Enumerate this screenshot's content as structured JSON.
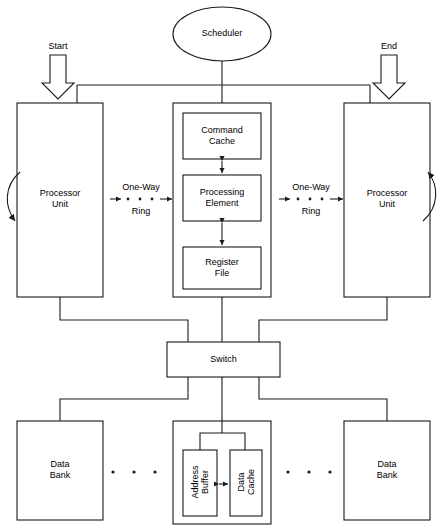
{
  "diagram": {
    "title_nodes": {
      "scheduler": "Scheduler",
      "start": "Start",
      "end": "End",
      "switch": "Switch"
    },
    "processor_left": {
      "label": "Processor\nUnit",
      "loop_icon": "curved-loop-arrow-icon"
    },
    "processor_right": {
      "label": "Processor\nUnit",
      "loop_icon": "curved-loop-arrow-icon"
    },
    "pipeline": {
      "command_cache": "Command\nCache",
      "processing_element": "Processing\nElement",
      "register_file": "Register\nFile"
    },
    "ring_left": {
      "line1": "One-Way",
      "line2": "Ring",
      "dots": 3
    },
    "ring_right": {
      "line1": "One-Way",
      "line2": "Ring",
      "dots": 3
    },
    "data_bank_left": "Data\nBank",
    "data_bank_right": "Data\nBank",
    "memory_unit": {
      "address_buffer": "Address\nBuffer",
      "data_cache": "Data\nCache"
    },
    "ellipsis_left_dots": 3,
    "ellipsis_right_dots": 3,
    "colors": {
      "stroke": "#1a1a1a",
      "fill": "#ffffff",
      "text": "#000000"
    }
  }
}
